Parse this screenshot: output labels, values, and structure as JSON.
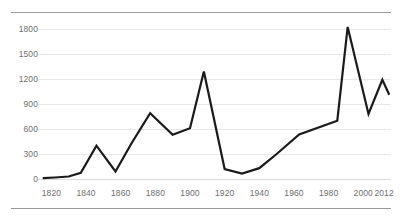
{
  "figure": {
    "caption_fragment": "",
    "background_color": "#ffffff",
    "rule_color": "#9a9a9a",
    "line_color": "#1a1a1a",
    "gridline_color": "#e8e8e8",
    "tick_label_color": "#6e6e6e"
  },
  "chart_data": {
    "type": "line",
    "title": "",
    "subtitle": "",
    "xlabel": "",
    "ylabel": "",
    "xlim": [
      1814,
      2016
    ],
    "ylim": [
      0,
      1900
    ],
    "grid": true,
    "grid_axis": "y",
    "legend": false,
    "legend_position": "none",
    "yticks": [
      0,
      300,
      600,
      900,
      1200,
      1500,
      1800
    ],
    "ytick_labels": [
      "0",
      "300",
      "600",
      "900",
      "1200",
      "1500",
      "1800"
    ],
    "xticks": [
      1820,
      1840,
      1860,
      1880,
      1900,
      1920,
      1940,
      1960,
      1980,
      2000,
      2012
    ],
    "xtick_labels": [
      "1820",
      "1840",
      "1860",
      "1880",
      "1900",
      "1920",
      "1940",
      "1960",
      "1980",
      "2000",
      "2012"
    ],
    "series": [
      {
        "name": "value",
        "color": "#1a1a1a",
        "line_width": 2.2,
        "x": [
          1815,
          1822,
          1830,
          1837,
          1846,
          1857,
          1866,
          1877,
          1890,
          1900,
          1908,
          1920,
          1930,
          1940,
          1950,
          1963,
          1985,
          1991,
          2003,
          2011,
          2015
        ],
        "y": [
          10,
          18,
          30,
          75,
          400,
          90,
          420,
          790,
          530,
          610,
          1290,
          120,
          65,
          130,
          300,
          535,
          700,
          1825,
          780,
          1190,
          1010
        ]
      }
    ]
  }
}
